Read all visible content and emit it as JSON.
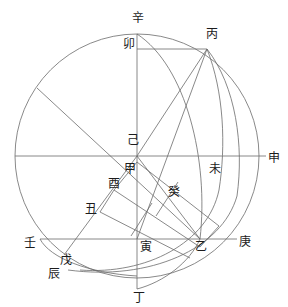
{
  "figure": {
    "kind": "geometric-diagram",
    "stroke_color": "#6b6b6b",
    "label_color": "#1c1c1c",
    "background": "#ffffff",
    "canvas": {
      "width": 288,
      "height": 307
    }
  },
  "labels": [
    {
      "id": "xin",
      "text": "辛",
      "x": 132,
      "y": 12,
      "role": "top-pole-point"
    },
    {
      "id": "mao",
      "text": "卯",
      "x": 123,
      "y": 38,
      "role": "upper-chord-left-end"
    },
    {
      "id": "bing",
      "text": "丙",
      "x": 206,
      "y": 28,
      "role": "upper-right-arc-point"
    },
    {
      "id": "ji",
      "text": "己",
      "x": 127,
      "y": 134,
      "role": "center-upper"
    },
    {
      "id": "jia",
      "text": "甲",
      "x": 124,
      "y": 163,
      "role": "center-lower"
    },
    {
      "id": "you",
      "text": "酉",
      "x": 108,
      "y": 178,
      "role": "left-inner-vertex"
    },
    {
      "id": "chou",
      "text": "丑",
      "x": 85,
      "y": 203,
      "role": "left-lower-vertex"
    },
    {
      "id": "gui",
      "text": "癸",
      "x": 168,
      "y": 186,
      "role": "inner-band-midpoint"
    },
    {
      "id": "wei",
      "text": "未",
      "x": 209,
      "y": 163,
      "role": "right-arc-on-horizontal"
    },
    {
      "id": "shen",
      "text": "申",
      "x": 268,
      "y": 152,
      "role": "right-horizontal-end"
    },
    {
      "id": "ren",
      "text": "壬",
      "x": 24,
      "y": 237,
      "role": "lower-left-horizontal-end"
    },
    {
      "id": "wu",
      "text": "戊",
      "x": 60,
      "y": 254,
      "role": "lower-left-arc-point"
    },
    {
      "id": "chen",
      "text": "辰",
      "x": 48,
      "y": 268,
      "role": "lower-left-circle-point"
    },
    {
      "id": "yin",
      "text": "寅",
      "x": 140,
      "y": 241,
      "role": "lower-vertical-node"
    },
    {
      "id": "yi",
      "text": "乙",
      "x": 195,
      "y": 241,
      "role": "lower-right-node"
    },
    {
      "id": "geng",
      "text": "庚",
      "x": 239,
      "y": 236,
      "role": "lower-right-horizontal-end"
    },
    {
      "id": "ding",
      "text": "丁",
      "x": 133,
      "y": 292,
      "role": "bottom-pole-point"
    }
  ],
  "geometry": {
    "main_circle": {
      "cx": 137,
      "cy": 156,
      "r": 122
    },
    "center_point": {
      "x": 137,
      "y": 156
    },
    "horizontal_diameter": {
      "x1": 15,
      "y1": 156,
      "x2": 283,
      "y2": 156
    },
    "vertical_diameter": {
      "x1": 137,
      "y1": 34,
      "x2": 137,
      "y2": 290
    },
    "arcs": [
      {
        "id": "arc-inner",
        "from": "辛",
        "to": "丁",
        "through": "乙"
      },
      {
        "id": "arc-middle",
        "from": "丙",
        "to": "辰",
        "through": "未"
      },
      {
        "id": "arc-outer",
        "from": "丙",
        "to": "辰",
        "through": "庚"
      }
    ],
    "chords": [
      {
        "id": "chord-mao-bing",
        "from": "卯",
        "to": "丙"
      },
      {
        "id": "chord-ren-geng",
        "from": "壬",
        "to": "庚"
      },
      {
        "id": "chord-oblique-main",
        "from": "upper-left-rim",
        "to": "乙"
      },
      {
        "id": "chord-bing-yin",
        "from": "丙",
        "to": "寅"
      },
      {
        "id": "chord-ji-yi",
        "from": "己",
        "to": "乙"
      }
    ],
    "inner_band": {
      "id": "gui-parallelogram-band",
      "vertices": [
        "甲",
        "酉",
        "丑",
        "癸"
      ],
      "note": "narrow parallel band running from centre down-right toward 乙"
    }
  }
}
